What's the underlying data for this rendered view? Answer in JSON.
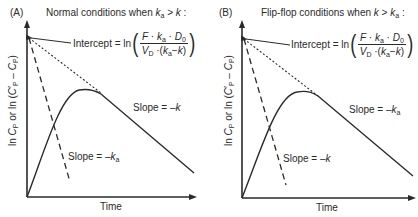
{
  "panels": [
    {
      "letter": "(A)",
      "title_prefix": "Normal conditions when ",
      "title_cond_left": "k",
      "title_cond_left_sub": "a",
      "title_cond_op": " > ",
      "title_cond_right": "k",
      "title_cond_right_sub": "",
      "title_suffix": " :",
      "intercept_label": "Intercept = ln",
      "formula": {
        "num_F": "F",
        "num_k": "k",
        "num_k_sub": "a",
        "num_D": "D",
        "num_D_sub": "0",
        "den_V": "V",
        "den_V_sub": "D",
        "den_k1": "k",
        "den_k1_sub": "a",
        "den_minus": "−",
        "den_k2": "k"
      },
      "slope_upper": {
        "prefix": "Slope = –",
        "var": "k",
        "sub": ""
      },
      "slope_lower": {
        "prefix": "Slope = –",
        "var": "k",
        "sub": "a"
      },
      "xlabel": "Time",
      "ylabel": {
        "p1": "ln ",
        "C": "C",
        "Csub": "P",
        "p2": " or ln (",
        "C2": "C",
        "C2sup": "′",
        "C2sub": "P",
        "minus": " – ",
        "C3": "C",
        "C3sub": "P",
        "p3": ")"
      }
    },
    {
      "letter": "(B)",
      "title_prefix": "Flip-flop conditions when ",
      "title_cond_left": "k",
      "title_cond_left_sub": "",
      "title_cond_op": " > ",
      "title_cond_right": "k",
      "title_cond_right_sub": "a",
      "title_suffix": " :",
      "intercept_label": "Intercept = ln",
      "formula": {
        "num_F": "F",
        "num_k": "k",
        "num_k_sub": "a",
        "num_D": "D",
        "num_D_sub": "0",
        "den_V": "V",
        "den_V_sub": "D",
        "den_k1": "k",
        "den_k1_sub": "a",
        "den_minus": "−",
        "den_k2": "k"
      },
      "slope_upper": {
        "prefix": "Slope = –",
        "var": "k",
        "sub": "a"
      },
      "slope_lower": {
        "prefix": "Slope = –",
        "var": "k",
        "sub": ""
      },
      "xlabel": "Time",
      "ylabel": {
        "p1": "ln ",
        "C": "C",
        "Csub": "P",
        "p2": " or ln (",
        "C2": "C",
        "C2sup": "′",
        "C2sub": "P",
        "minus": " – ",
        "C3": "C",
        "C3sub": "P",
        "p3": ")"
      }
    }
  ],
  "colors": {
    "ink": "#2a2a2a",
    "background": "#ffffff"
  }
}
